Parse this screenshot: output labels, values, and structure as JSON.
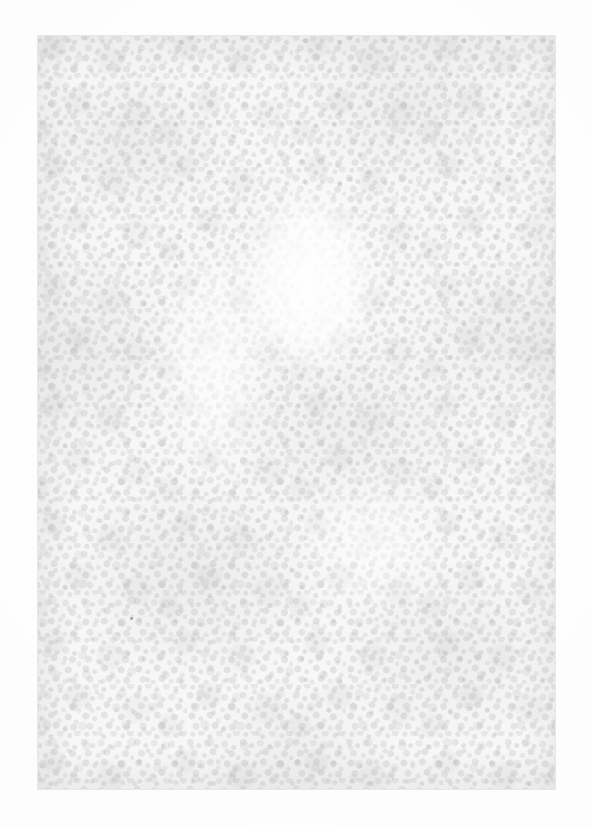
{
  "document": {
    "kind": "scanned-blank-page",
    "title": "",
    "body_text": "",
    "caption": "",
    "page_number": "",
    "visible_text_content": []
  },
  "canvas": {
    "width": 592,
    "height": 826,
    "background_color": "#ffffff"
  },
  "scan_frame": {
    "left": 37,
    "top": 35,
    "width": 519,
    "height": 755,
    "border_color": "#787880",
    "paper_color": "#f7f7f7"
  },
  "texture": {
    "description": "mottled fibrous paper grain",
    "grain_color": "#96969b",
    "blotch_color": "#8c8c94",
    "light_tone": "#fafafa",
    "mid_tone": "#f2f2f2",
    "dark_fleck_tone": "#d8d8d8"
  },
  "highlights": [
    {
      "name": "upper-center-oval",
      "left": 196,
      "top": 142,
      "width": 150,
      "height": 205
    },
    {
      "name": "left-vertical-band",
      "left": 118,
      "top": 196,
      "width": 120,
      "height": 260
    },
    {
      "name": "lower-center-patch",
      "left": 250,
      "top": 430,
      "width": 170,
      "height": 150
    }
  ],
  "marks": [
    {
      "name": "dark-speck",
      "left": 129,
      "top": 616
    }
  ]
}
